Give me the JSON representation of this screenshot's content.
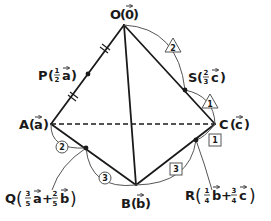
{
  "diagram": {
    "colors": {
      "line": "#1a1a1a",
      "arc": "#555555",
      "background": "#ffffff"
    },
    "points": {
      "O": {
        "name": "O",
        "vec": "0",
        "x": 124,
        "y": 25
      },
      "A": {
        "name": "A",
        "vec": "a",
        "x": 51,
        "y": 124
      },
      "B": {
        "name": "B",
        "vec": "b",
        "x": 136,
        "y": 185
      },
      "C": {
        "name": "C",
        "vec": "c",
        "x": 215,
        "y": 124
      },
      "P": {
        "name": "P",
        "coef": "1/2",
        "vec": "a",
        "x": 88,
        "y": 74
      },
      "Q": {
        "name": "Q",
        "terms": [
          {
            "num": "3",
            "den": "5",
            "vec": "a"
          },
          {
            "num": "2",
            "den": "5",
            "vec": "b"
          }
        ],
        "x": 86,
        "y": 148
      },
      "R": {
        "name": "R",
        "terms": [
          {
            "num": "1",
            "den": "4",
            "vec": "b"
          },
          {
            "num": "3",
            "den": "4",
            "vec": "c"
          }
        ],
        "x": 196,
        "y": 140
      },
      "S": {
        "name": "S",
        "coef": "2/3",
        "vec": "c",
        "x": 185,
        "y": 90
      }
    },
    "labels": {
      "O": "O",
      "O_vec": "0",
      "A": "A",
      "A_vec": "a",
      "B": "B",
      "B_vec": "b",
      "C": "C",
      "C_vec": "c",
      "P": "P",
      "P_num": "1",
      "P_den": "2",
      "P_vec": "a",
      "S": "S",
      "S_num": "2",
      "S_den": "3",
      "S_vec": "c",
      "Q": "Q",
      "Q_n1": "3",
      "Q_d1": "5",
      "Q_v1": "a",
      "Q_plus": "+",
      "Q_n2": "2",
      "Q_d2": "5",
      "Q_v2": "b",
      "R": "R",
      "R_n1": "1",
      "R_d1": "4",
      "R_v1": "b",
      "R_plus": "+",
      "R_n2": "3",
      "R_d2": "4",
      "R_v2": "c"
    },
    "ratio_marks": {
      "OS_triangle": "2",
      "SC_triangle": "1",
      "AQ_circle": "2",
      "QB_circle": "3",
      "BR_square": "3",
      "RC_square": "1"
    },
    "edges": [
      "OA",
      "OB",
      "OC",
      "AB",
      "BC"
    ],
    "dashed_edges": [
      "AC"
    ],
    "equal_ticks": [
      "OP",
      "PA"
    ]
  }
}
